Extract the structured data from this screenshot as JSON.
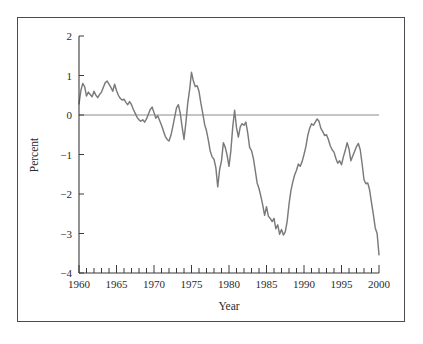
{
  "figure": {
    "frame_color": "#4a4a52",
    "background": "#ffffff"
  },
  "chart_data": {
    "type": "line",
    "title": "",
    "subtitle": "",
    "xlabel": "Year",
    "ylabel": "Percent",
    "xlim": [
      1960,
      2000
    ],
    "ylim": [
      -4,
      2
    ],
    "grid": false,
    "legend": null,
    "series_color": "#7a7a7a",
    "zero_line": {
      "value": 0,
      "color": "#8a8a8a",
      "visible": true
    },
    "xticks_major": [
      1960,
      1965,
      1970,
      1975,
      1980,
      1985,
      1990,
      1995,
      2000
    ],
    "xtick_labels": [
      "1960",
      "1965",
      "1970",
      "1975",
      "1980",
      "1985",
      "1990",
      "1995",
      "2000"
    ],
    "xticks_minor_step": 1,
    "yticks": [
      2,
      1,
      0,
      -1,
      -2,
      -3,
      -4
    ],
    "ytick_labels": [
      "2",
      "1",
      "0",
      "−1",
      "−2",
      "−3",
      "−4"
    ],
    "series": [
      {
        "name": "Percent",
        "x": [
          1960.0,
          1960.25,
          1960.5,
          1960.75,
          1961.0,
          1961.25,
          1961.5,
          1961.75,
          1962.0,
          1962.25,
          1962.5,
          1962.75,
          1963.0,
          1963.25,
          1963.5,
          1963.75,
          1964.0,
          1964.25,
          1964.5,
          1964.75,
          1965.0,
          1965.25,
          1965.5,
          1965.75,
          1966.0,
          1966.25,
          1966.5,
          1966.75,
          1967.0,
          1967.25,
          1967.5,
          1967.75,
          1968.0,
          1968.25,
          1968.5,
          1968.75,
          1969.0,
          1969.25,
          1969.5,
          1969.75,
          1970.0,
          1970.25,
          1970.5,
          1970.75,
          1971.0,
          1971.25,
          1971.5,
          1971.75,
          1972.0,
          1972.25,
          1972.5,
          1972.75,
          1973.0,
          1973.25,
          1973.5,
          1973.75,
          1974.0,
          1974.25,
          1974.5,
          1974.75,
          1975.0,
          1975.25,
          1975.5,
          1975.75,
          1976.0,
          1976.25,
          1976.5,
          1976.75,
          1977.0,
          1977.25,
          1977.5,
          1977.75,
          1978.0,
          1978.25,
          1978.5,
          1978.75,
          1979.0,
          1979.25,
          1979.5,
          1979.75,
          1980.0,
          1980.25,
          1980.5,
          1980.75,
          1981.0,
          1981.25,
          1981.5,
          1981.75,
          1982.0,
          1982.25,
          1982.5,
          1982.75,
          1983.0,
          1983.25,
          1983.5,
          1983.75,
          1984.0,
          1984.25,
          1984.5,
          1984.75,
          1985.0,
          1985.25,
          1985.5,
          1985.75,
          1986.0,
          1986.25,
          1986.5,
          1986.75,
          1987.0,
          1987.25,
          1987.5,
          1987.75,
          1988.0,
          1988.25,
          1988.5,
          1988.75,
          1989.0,
          1989.25,
          1989.5,
          1989.75,
          1990.0,
          1990.25,
          1990.5,
          1990.75,
          1991.0,
          1991.25,
          1991.5,
          1991.75,
          1992.0,
          1992.25,
          1992.5,
          1992.75,
          1993.0,
          1993.25,
          1993.5,
          1993.75,
          1994.0,
          1994.25,
          1994.5,
          1994.75,
          1995.0,
          1995.25,
          1995.5,
          1995.75,
          1996.0,
          1996.25,
          1996.5,
          1996.75,
          1997.0,
          1997.25,
          1997.5,
          1997.75,
          1998.0,
          1998.25,
          1998.5,
          1998.75,
          1999.0,
          1999.25,
          1999.5,
          1999.75,
          2000.0
        ],
        "values": [
          0.28,
          0.62,
          0.8,
          0.72,
          0.48,
          0.58,
          0.52,
          0.46,
          0.6,
          0.5,
          0.44,
          0.52,
          0.58,
          0.7,
          0.82,
          0.86,
          0.78,
          0.7,
          0.6,
          0.78,
          0.62,
          0.5,
          0.42,
          0.38,
          0.4,
          0.32,
          0.26,
          0.34,
          0.26,
          0.14,
          0.04,
          -0.06,
          -0.12,
          -0.16,
          -0.12,
          -0.18,
          -0.1,
          0.02,
          0.14,
          0.2,
          0.06,
          -0.08,
          -0.02,
          -0.14,
          -0.26,
          -0.4,
          -0.54,
          -0.62,
          -0.66,
          -0.52,
          -0.3,
          -0.06,
          0.18,
          0.26,
          0.04,
          -0.3,
          -0.62,
          -0.2,
          0.3,
          0.64,
          1.08,
          0.86,
          0.72,
          0.74,
          0.6,
          0.3,
          0.04,
          -0.24,
          -0.4,
          -0.64,
          -0.92,
          -1.06,
          -1.12,
          -1.34,
          -1.82,
          -1.38,
          -1.16,
          -0.7,
          -0.82,
          -1.02,
          -1.3,
          -0.9,
          -0.3,
          0.12,
          -0.32,
          -0.56,
          -0.3,
          -0.22,
          -0.26,
          -0.18,
          -0.46,
          -0.82,
          -0.9,
          -1.1,
          -1.4,
          -1.72,
          -1.86,
          -2.06,
          -2.28,
          -2.54,
          -2.32,
          -2.56,
          -2.62,
          -2.7,
          -2.62,
          -2.88,
          -2.78,
          -3.02,
          -2.9,
          -3.04,
          -2.96,
          -2.7,
          -2.26,
          -1.92,
          -1.7,
          -1.52,
          -1.4,
          -1.24,
          -1.3,
          -1.18,
          -1.0,
          -0.8,
          -0.52,
          -0.34,
          -0.22,
          -0.26,
          -0.18,
          -0.1,
          -0.16,
          -0.34,
          -0.42,
          -0.52,
          -0.5,
          -0.62,
          -0.78,
          -0.88,
          -0.94,
          -1.1,
          -1.22,
          -1.16,
          -1.26,
          -1.06,
          -0.9,
          -0.7,
          -0.86,
          -1.16,
          -1.04,
          -0.92,
          -0.8,
          -0.72,
          -0.88,
          -1.24,
          -1.64,
          -1.74,
          -1.72,
          -1.9,
          -2.22,
          -2.52,
          -2.86,
          -3.0,
          -3.54
        ]
      }
    ]
  }
}
